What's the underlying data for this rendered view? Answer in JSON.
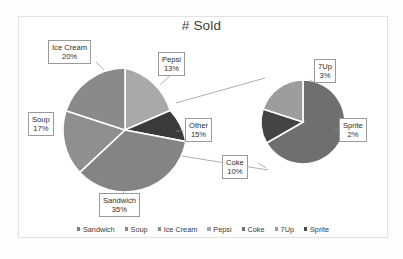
{
  "chart": {
    "title": "# Sold",
    "frame_border_color": "#e2e2e2",
    "background": "#ffffff"
  },
  "chart_data": {
    "type": "pie",
    "title": "# Sold",
    "subtitle": "",
    "xlabel": "",
    "ylabel": "",
    "variant": "pie-of-pie",
    "legend_position": "bottom",
    "grid": false,
    "value_format": "percent",
    "categories": [
      "Sandwich",
      "Soup",
      "Ice Cream",
      "Pepsi",
      "Coke",
      "7Up",
      "Sprite"
    ],
    "primary_pie": {
      "name": "Main pie",
      "labels": [
        "Sandwich",
        "Soup",
        "Ice Cream",
        "Pepsi",
        "Other"
      ],
      "values": [
        35,
        17,
        20,
        13,
        15
      ],
      "colors": [
        "#828282",
        "#8c8c8c",
        "#8a8a8a",
        "#a8a8a8",
        "#3a3a3a"
      ]
    },
    "secondary_pie": {
      "name": "Other breakdown",
      "labels": [
        "Coke",
        "7Up",
        "Sprite"
      ],
      "values": [
        10,
        3,
        2
      ],
      "colors": [
        "#6f6f6f",
        "#9b9b9b",
        "#4a4a4a"
      ]
    },
    "annotations": [
      {
        "label": "Ice Cream",
        "value": "20%"
      },
      {
        "label": "Pepsi",
        "value": "13%"
      },
      {
        "label": "Soup",
        "value": "17%"
      },
      {
        "label": "Other",
        "value": "15%"
      },
      {
        "label": "Sandwich",
        "value": "35%"
      },
      {
        "label": "Coke",
        "value": "10%"
      },
      {
        "label": "7Up",
        "value": "3%"
      },
      {
        "label": "Sprite",
        "value": "2%"
      }
    ]
  },
  "callouts": {
    "ice_cream": {
      "label": "Ice Cream",
      "value": "20%"
    },
    "pepsi": {
      "label": "Pepsi",
      "value": "13%"
    },
    "soup": {
      "label": "Soup",
      "value": "17%"
    },
    "other": {
      "label": "Other",
      "value": "15%"
    },
    "sandwich": {
      "label": "Sandwich",
      "value": "35%"
    },
    "coke": {
      "label": "Coke",
      "value": "10%"
    },
    "sevenup": {
      "label": "7Up",
      "value": "3%"
    },
    "sprite": {
      "label": "Sprite",
      "value": "2%"
    }
  },
  "legend": {
    "items": [
      {
        "label": "Sandwich",
        "color": "#7f7f7f"
      },
      {
        "label": "Soup",
        "color": "#8a8a8a"
      },
      {
        "label": "Ice Cream",
        "color": "#8a8a8a"
      },
      {
        "label": "Pepsi",
        "color": "#a8a8a8"
      },
      {
        "label": "Coke",
        "color": "#6f6f6f"
      },
      {
        "label": "7Up",
        "color": "#9b9b9b"
      },
      {
        "label": "Sprite",
        "color": "#4a4a4a"
      }
    ]
  }
}
